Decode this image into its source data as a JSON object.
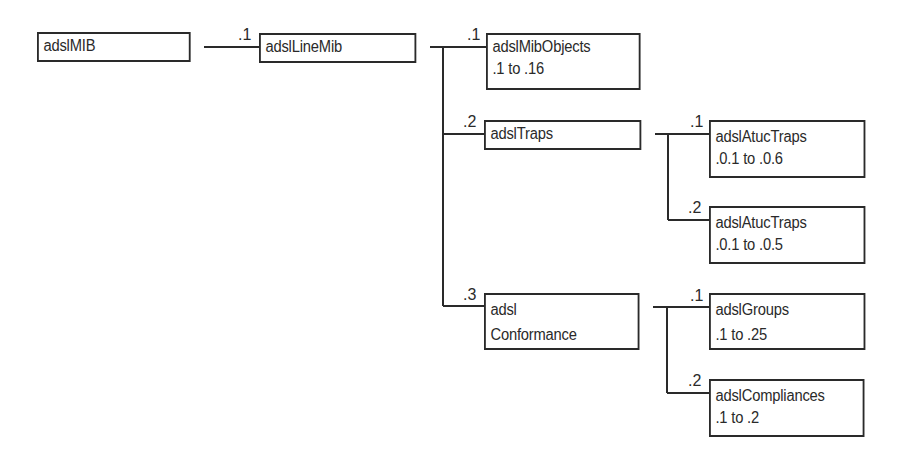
{
  "diagram": {
    "type": "mib-tree",
    "nodes": [
      {
        "id": "adslMIB",
        "lines": [
          "adslMIB"
        ]
      },
      {
        "id": "adslLineMib",
        "lines": [
          "adslLineMib"
        ],
        "edge_label": ".1"
      },
      {
        "id": "adslMibObjects",
        "lines": [
          "adslMibObjects",
          ".1 to .16"
        ],
        "edge_label": ".1"
      },
      {
        "id": "adslTraps",
        "lines": [
          "adslTraps"
        ],
        "edge_label": ".2"
      },
      {
        "id": "adslAtucTraps1",
        "lines": [
          "adslAtucTraps",
          ".0.1 to .0.6"
        ],
        "edge_label": ".1"
      },
      {
        "id": "adslAtucTraps2",
        "lines": [
          "adslAtucTraps",
          ".0.1 to .0.5"
        ],
        "edge_label": ".2"
      },
      {
        "id": "adslConformance",
        "lines": [
          "adsl",
          "Conformance"
        ],
        "edge_label": ".3"
      },
      {
        "id": "adslGroups",
        "lines": [
          "adslGroups",
          ".1 to .25"
        ],
        "edge_label": ".1"
      },
      {
        "id": "adslCompliances",
        "lines": [
          "adslCompliances",
          ".1 to .2"
        ],
        "edge_label": ".2"
      }
    ],
    "edges": [
      [
        "adslMIB",
        "adslLineMib"
      ],
      [
        "adslLineMib",
        "adslMibObjects"
      ],
      [
        "adslLineMib",
        "adslTraps"
      ],
      [
        "adslLineMib",
        "adslConformance"
      ],
      [
        "adslTraps",
        "adslAtucTraps1"
      ],
      [
        "adslTraps",
        "adslAtucTraps2"
      ],
      [
        "adslConformance",
        "adslGroups"
      ],
      [
        "adslConformance",
        "adslCompliances"
      ]
    ]
  }
}
